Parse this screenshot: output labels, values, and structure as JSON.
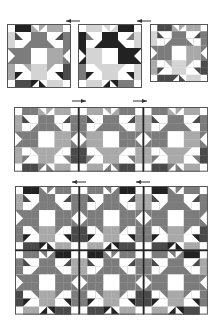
{
  "diagram": {
    "colors": {
      "W": "#ffffff",
      "L": "#d4d4d4",
      "M": "#a9a9a9",
      "G": "#7c7c7c",
      "D": "#4a4a4a",
      "K": "#222222",
      "outline": "#555555",
      "arrow": "#333333"
    },
    "block_pattern": {
      "grid": 8,
      "cells": [
        [
          "W",
          "K",
          "K",
          "t:M/W:tr",
          "t:W/M:tl",
          "M",
          "M",
          "W"
        ],
        [
          "L",
          "t:W/D:bl",
          "W",
          "G",
          "G",
          "W",
          "t:W/D:br",
          "G"
        ],
        [
          "L",
          "W",
          "t:G/W:tl",
          "G",
          "G",
          "t:G/W:tr",
          "W",
          "G"
        ],
        [
          "t:W/G:tr",
          "G",
          "G",
          "W",
          "W",
          "M",
          "M",
          "t:W/G:tl"
        ],
        [
          "t:W/G:br",
          "G",
          "G",
          "W",
          "W",
          "M",
          "M",
          "t:W/G:bl"
        ],
        [
          "M",
          "W",
          "t:M/W:bl",
          "L",
          "L",
          "t:M/W:br",
          "W",
          "D"
        ],
        [
          "M",
          "t:W/K:tl",
          "W",
          "L",
          "L",
          "W",
          "t:W/K:tr",
          "D"
        ],
        [
          "W",
          "D",
          "D",
          "t:K/W:br",
          "t:W/K:bl",
          "L",
          "L",
          "W"
        ]
      ]
    },
    "steps": [
      {
        "name": "step-1-individual-blocks",
        "arrows": [
          {
            "x": 66,
            "y": 19,
            "w": 14,
            "direction": "left"
          },
          {
            "x": 137,
            "y": 19,
            "w": 14,
            "direction": "left"
          }
        ],
        "panels": [
          {
            "x": 7,
            "y": 24,
            "cols": 1,
            "rows": 1,
            "size": 64,
            "variant": 0
          },
          {
            "x": 78,
            "y": 24,
            "cols": 1,
            "rows": 1,
            "size": 64,
            "variant": 1
          },
          {
            "x": 150,
            "y": 24,
            "cols": 1,
            "rows": 1,
            "size": 58,
            "variant": 2
          }
        ]
      },
      {
        "name": "step-2-joined-row",
        "arrows": [
          {
            "x": 72,
            "y": 99,
            "w": 14,
            "direction": "right"
          },
          {
            "x": 133,
            "y": 99,
            "w": 14,
            "direction": "right"
          }
        ],
        "panels": [
          {
            "x": 14,
            "y": 107,
            "cols": 3,
            "rows": 1,
            "size": 64.7,
            "variant": 3
          }
        ]
      },
      {
        "name": "step-3-joined-rows",
        "arrows": [
          {
            "x": 72,
            "y": 180,
            "w": 14,
            "direction": "left"
          },
          {
            "x": 136,
            "y": 180,
            "w": 14,
            "direction": "left"
          }
        ],
        "panels": [
          {
            "x": 15,
            "y": 186,
            "cols": 3,
            "rows": 2,
            "size": 64.3,
            "variant": 4
          }
        ]
      }
    ],
    "variants": [
      {
        "swap": {}
      },
      {
        "swap": {
          "G": "K",
          "M": "L",
          "D": "G"
        }
      },
      {
        "swap": {
          "K": "D",
          "G": "G",
          "M": "M"
        }
      },
      {
        "swap": {
          "K": "G",
          "L": "M"
        }
      },
      {
        "swap": {
          "L": "M",
          "M": "G"
        }
      }
    ]
  }
}
